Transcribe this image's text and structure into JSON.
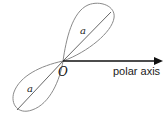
{
  "diagram": {
    "type": "lemniscate",
    "origin_label": "O",
    "axis_label": "polar axis",
    "lobes": [
      {
        "position": "upper-right",
        "diameter_label": "a"
      },
      {
        "position": "lower-left",
        "diameter_label": "a"
      }
    ],
    "colors": {
      "curve": "#8a8a8a",
      "diameter": "#555555",
      "axis": "#111111"
    }
  }
}
